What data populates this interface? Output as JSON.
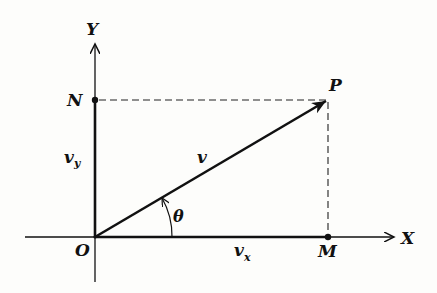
{
  "diagram": {
    "type": "vector-components",
    "axes": {
      "x_label": "X",
      "y_label": "Y"
    },
    "points": {
      "origin": "O",
      "tip": "P",
      "x_projection": "M",
      "y_projection": "N"
    },
    "vector": {
      "label": "v",
      "x_component": "v",
      "x_component_sub": "x",
      "y_component": "v",
      "y_component_sub": "y"
    },
    "angle": {
      "label": "θ"
    }
  },
  "colors": {
    "ink": "#111111",
    "background": "#fdfdfb"
  }
}
